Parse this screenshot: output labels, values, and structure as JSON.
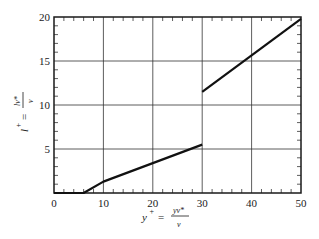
{
  "chart_data": {
    "type": "line",
    "title": "",
    "xlabel": "y+ = y v* / ν",
    "ylabel": "l+ = l v* / ν",
    "xlim": [
      0,
      50
    ],
    "ylim": [
      0,
      20
    ],
    "grid": true,
    "x_ticks": [
      "0",
      "10",
      "20",
      "30",
      "40",
      "50"
    ],
    "y_ticks": [
      "5",
      "10",
      "15",
      "20"
    ],
    "series": [
      {
        "name": "segment-1",
        "x": [
          0,
          6,
          10,
          30
        ],
        "y": [
          0,
          0,
          1.3,
          5.5
        ]
      },
      {
        "name": "segment-2",
        "x": [
          30,
          50
        ],
        "y": [
          11.5,
          19.8
        ]
      }
    ]
  },
  "labels": {
    "x_axis": {
      "main": "y",
      "sup": "+",
      "eq": "=",
      "num": "yv*",
      "den": "ν"
    },
    "y_axis": {
      "main": "l",
      "sup": "+",
      "eq": "=",
      "num": "lv*",
      "den": "ν"
    }
  }
}
